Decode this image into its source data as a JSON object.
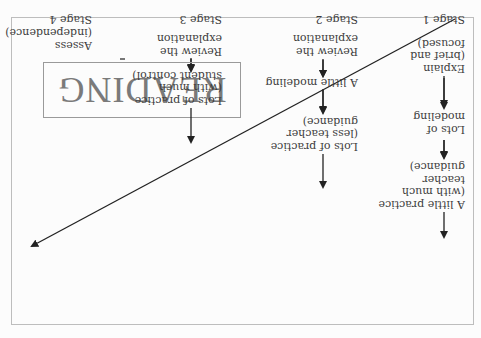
{
  "figure": {
    "title": "READING",
    "orientation": "rotated 180°",
    "top_cut_text": "Chapter heading",
    "line_color": "#222222",
    "text_color": "#3c3c3c",
    "title_color": "#7a7a7a"
  },
  "stages": [
    {
      "stage": "Stage 1",
      "steps": [
        "Explain\n(brief and\nfocused)",
        "Lots of\nmodeling",
        "A little practice\n(with much\nteacher\nguidance)"
      ]
    },
    {
      "stage": "Stage 2",
      "steps": [
        "Review the\nexplanation",
        "A little modeling",
        "Lots of practice\n(less teacher\nguidance)"
      ]
    },
    {
      "stage": "Stage 3",
      "steps": [
        "Review the\nexplanation",
        "Lots of practice\n(with much\nstudent control)"
      ]
    },
    {
      "stage": "Stage 4",
      "steps": [
        "Assess\n(independence)"
      ]
    }
  ]
}
